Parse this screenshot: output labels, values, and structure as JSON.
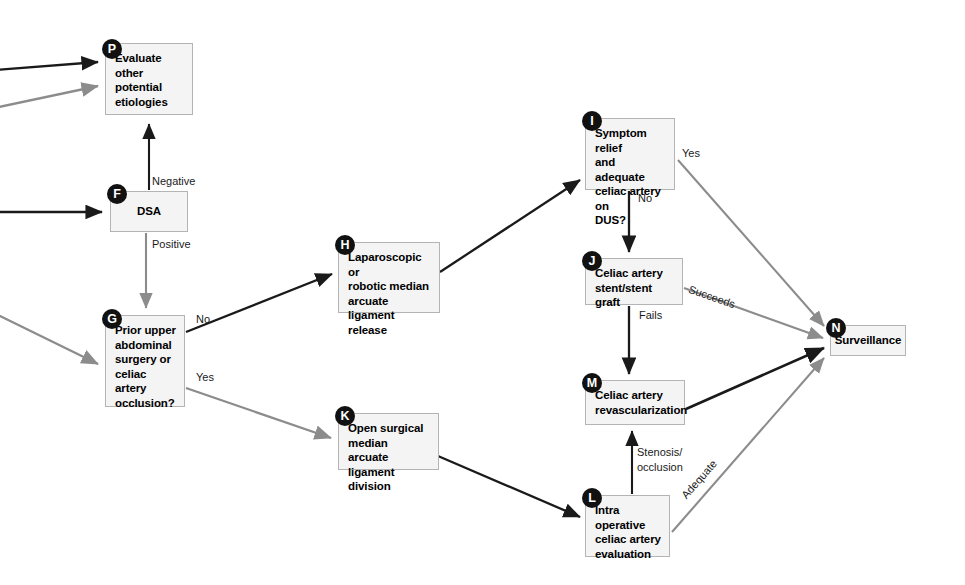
{
  "diagram": {
    "colors": {
      "node_fill": "#f4f4f4",
      "node_border": "#b4b4b4",
      "badge_fill": "#111111",
      "badge_text": "#ffffff",
      "edge_dark": "#1a1a1a",
      "edge_gray": "#8c8c8c",
      "text": "#000000",
      "background": "#ffffff"
    },
    "nodes": [
      {
        "id": "P",
        "badge": "P",
        "label": "Evaluate\nother potential\netiologies",
        "lines": [
          "Evaluate",
          "other potential",
          "etiologies"
        ]
      },
      {
        "id": "F",
        "badge": "F",
        "label": "DSA",
        "lines": [
          "DSA"
        ]
      },
      {
        "id": "G",
        "badge": "G",
        "label": "Prior upper\nabdominal\nsurgery or\nceliac artery\nocclusion?",
        "lines": [
          "Prior upper",
          "abdominal",
          "surgery or",
          "celiac artery",
          "occlusion?"
        ]
      },
      {
        "id": "H",
        "badge": "H",
        "label": "Laparoscopic or\nrobotic median\narcuate ligament\nrelease",
        "lines": [
          "Laparoscopic or",
          "robotic median",
          "arcuate ligament",
          "release"
        ]
      },
      {
        "id": "I",
        "badge": "I",
        "label": "Symptom relief\nand adequate\nceliac artery on\nDUS?",
        "lines": [
          "Symptom relief",
          "and adequate",
          "celiac artery on",
          "DUS?"
        ]
      },
      {
        "id": "J",
        "badge": "J",
        "label": "Celiac artery\nstent/stent graft",
        "lines": [
          "Celiac artery",
          "stent/stent graft"
        ]
      },
      {
        "id": "K",
        "badge": "K",
        "label": "Open surgical\nmedian arcuate\nligament division",
        "lines": [
          "Open surgical",
          "median arcuate",
          "ligament division"
        ]
      },
      {
        "id": "L",
        "badge": "L",
        "label": "Intra operative\nceliac artery\nevaluation",
        "lines": [
          "Intra operative",
          "celiac artery",
          "evaluation"
        ]
      },
      {
        "id": "M",
        "badge": "M",
        "label": "Celiac artery\nrevascularization",
        "lines": [
          "Celiac artery",
          "revascularization"
        ]
      },
      {
        "id": "N",
        "badge": "N",
        "label": "Surveillance",
        "lines": [
          "Surveillance"
        ]
      }
    ],
    "edge_labels": [
      {
        "id": "negative",
        "text": "Negative"
      },
      {
        "id": "positive",
        "text": "Positive"
      },
      {
        "id": "g-no",
        "text": "No"
      },
      {
        "id": "g-yes",
        "text": "Yes"
      },
      {
        "id": "i-yes",
        "text": "Yes"
      },
      {
        "id": "i-no",
        "text": "No"
      },
      {
        "id": "j-succeeds",
        "text": "Succeeds"
      },
      {
        "id": "j-fails",
        "text": "Fails"
      },
      {
        "id": "l-stenosis",
        "text": "Stenosis/\nocclusion"
      },
      {
        "id": "l-stenosis-line1",
        "text": "Stenosis/"
      },
      {
        "id": "l-stenosis-line2",
        "text": "occlusion"
      },
      {
        "id": "l-adequate",
        "text": "Adequate"
      }
    ]
  }
}
